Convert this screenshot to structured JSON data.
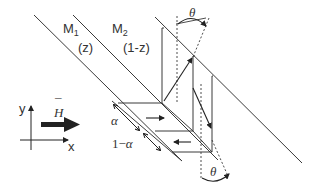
{
  "diagram": {
    "layers": [
      {
        "name": "M",
        "subscript": "1",
        "fraction": "(z)"
      },
      {
        "name": "M",
        "subscript": "2",
        "fraction": "(1-z)"
      }
    ],
    "angle_label_top": "θ",
    "angle_label_bottom": "θ",
    "alpha_label": "α",
    "one_minus_alpha_prefix": "1−",
    "one_minus_alpha_symbol": "α",
    "field_label": "H",
    "field_overbar": "¯",
    "axis_y": "y",
    "axis_x": "x",
    "colors": {
      "line": "#3a3a3a",
      "background": "#ffffff"
    }
  }
}
